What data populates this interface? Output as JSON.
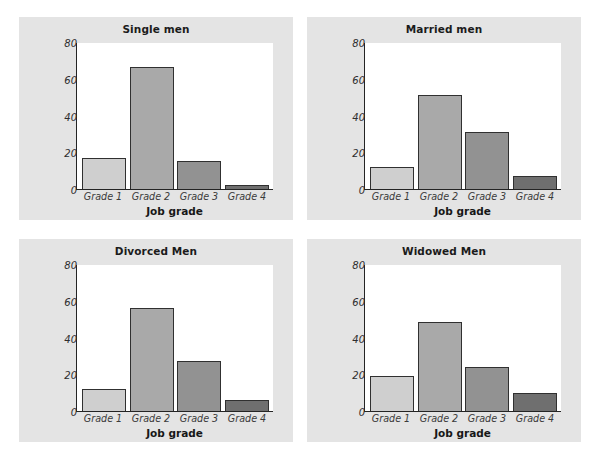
{
  "figure": {
    "background_color": "#ffffff",
    "panel_background_color": "#e4e4e4",
    "plot_background_color": "#ffffff",
    "axis_color": "#242424"
  },
  "chart_data": [
    {
      "type": "bar",
      "title": "Single men",
      "categories": [
        "Grade 1",
        "Grade 2",
        "Grade 3",
        "Grade 4"
      ],
      "values": [
        17,
        66.5,
        15,
        2
      ],
      "xlabel": "Job grade",
      "ylabel": "Percent of subjects",
      "ylim": [
        0,
        80
      ],
      "yticks": [
        0,
        20,
        40,
        60,
        80
      ],
      "ytick_labels": [
        "0",
        "20",
        "40",
        "60",
        "80"
      ],
      "grid": false,
      "legend": "none",
      "bar_colors": [
        "#cfcfcf",
        "#a9a9a9",
        "#929292",
        "#6f6f6f"
      ]
    },
    {
      "type": "bar",
      "title": "Married men",
      "categories": [
        "Grade 1",
        "Grade 2",
        "Grade 3",
        "Grade 4"
      ],
      "values": [
        12,
        51,
        31,
        7
      ],
      "xlabel": "Job grade",
      "ylabel": "Percent of subjects",
      "ylim": [
        0,
        80
      ],
      "yticks": [
        0,
        20,
        40,
        60,
        80
      ],
      "ytick_labels": [
        "0",
        "20",
        "40",
        "60",
        "80"
      ],
      "grid": false,
      "legend": "none",
      "bar_colors": [
        "#cfcfcf",
        "#a9a9a9",
        "#929292",
        "#6f6f6f"
      ]
    },
    {
      "type": "bar",
      "title": "Divorced Men",
      "categories": [
        "Grade 1",
        "Grade 2",
        "Grade 3",
        "Grade 4"
      ],
      "values": [
        12,
        56,
        27,
        6
      ],
      "xlabel": "Job grade",
      "ylabel": "Percent of subjects",
      "ylim": [
        0,
        80
      ],
      "yticks": [
        0,
        20,
        40,
        60,
        80
      ],
      "ytick_labels": [
        "0",
        "20",
        "40",
        "60",
        "80"
      ],
      "grid": false,
      "legend": "none",
      "bar_colors": [
        "#cfcfcf",
        "#a9a9a9",
        "#929292",
        "#6f6f6f"
      ]
    },
    {
      "type": "bar",
      "title": "Widowed Men",
      "categories": [
        "Grade 1",
        "Grade 2",
        "Grade 3",
        "Grade 4"
      ],
      "values": [
        19,
        48.5,
        24,
        10
      ],
      "xlabel": "Job grade",
      "ylabel": "Percent of subjects",
      "ylim": [
        0,
        80
      ],
      "yticks": [
        0,
        20,
        40,
        60,
        80
      ],
      "ytick_labels": [
        "0",
        "20",
        "40",
        "60",
        "80"
      ],
      "grid": false,
      "legend": "none",
      "bar_colors": [
        "#cfcfcf",
        "#a9a9a9",
        "#929292",
        "#6f6f6f"
      ]
    }
  ]
}
